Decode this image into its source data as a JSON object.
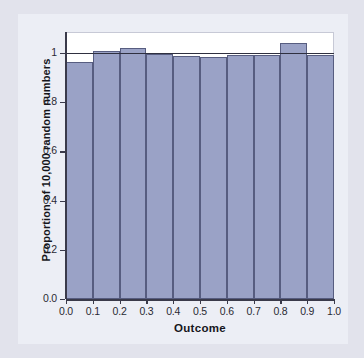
{
  "chart_data": {
    "type": "bar",
    "title": "",
    "subtitle": "",
    "xlabel": "Outcome",
    "ylabel": "Proportion of 10,000 random numbers",
    "categories": [
      "0.0-0.1",
      "0.1-0.2",
      "0.2-0.3",
      "0.3-0.4",
      "0.4-0.5",
      "0.5-0.6",
      "0.6-0.7",
      "0.7-0.8",
      "0.8-0.9",
      "0.9-1.0"
    ],
    "bin_edges": [
      0.0,
      0.1,
      0.2,
      0.3,
      0.4,
      0.5,
      0.6,
      0.7,
      0.8,
      0.9,
      1.0
    ],
    "values": [
      0.962,
      1.006,
      1.019,
      0.995,
      0.986,
      0.984,
      0.992,
      0.992,
      1.039,
      0.991
    ],
    "reference_line": 1.0,
    "xlim": [
      0.0,
      1.0
    ],
    "ylim": [
      0.0,
      1.085
    ],
    "xticks": [
      0.0,
      0.1,
      0.2,
      0.3,
      0.4,
      0.5,
      0.6,
      0.7,
      0.8,
      0.9,
      1.0
    ],
    "xticklabels": [
      "0.0",
      "0.1",
      "0.2",
      "0.3",
      "0.4",
      "0.5",
      "0.6",
      "0.7",
      "0.8",
      "0.9",
      "1.0"
    ],
    "yticks": [
      0.0,
      0.2,
      0.4,
      0.6,
      0.8,
      1.0
    ],
    "yticklabels": [
      "0.0",
      "0.2",
      "0.4",
      "0.6",
      "0.8",
      "1"
    ],
    "grid": false,
    "legend": null,
    "legend_position": "none",
    "annotations": [],
    "colors": {
      "bar_fill": "#9aa2c6",
      "bar_edge": "#575d80",
      "axis": "#3a3a4a",
      "reference_line": "#2f3040",
      "plot_background": "#ffffff",
      "figure_background": "#eceef5",
      "page_background": "#e2e3ec",
      "text": "#16161c"
    }
  }
}
